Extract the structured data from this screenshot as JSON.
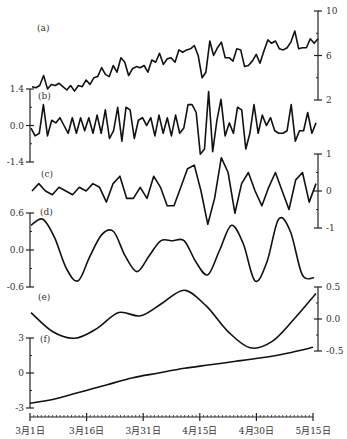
{
  "chart_data": {
    "type": "line",
    "title": "",
    "xlabel": "",
    "x_tick_labels": [
      "3月1日",
      "3月16日",
      "3月31日",
      "4月15日",
      "4月30日",
      "5月15日"
    ],
    "x_range": [
      "3月1日",
      "5月15日"
    ],
    "panels": [
      {
        "label": "(a)",
        "axis_side": "right",
        "yticks": [
          "10",
          "6",
          "2"
        ],
        "ylim": [
          2,
          10
        ],
        "description": "original series, rising trend with noise",
        "values": [
          3.2,
          3.1,
          3.3,
          4.2,
          3.0,
          3.4,
          3.3,
          3.5,
          3.2,
          2.9,
          3.3,
          2.8,
          3.3,
          3.2,
          3.8,
          3.4,
          4.0,
          4.1,
          4.9,
          4.3,
          4.1,
          5.1,
          4.5,
          5.8,
          5.4,
          4.2,
          4.8,
          5.0,
          4.9,
          5.1,
          4.5,
          5.6,
          5.4,
          6.2,
          5.2,
          5.7,
          5.8,
          5.4,
          6.5,
          6.3,
          6.5,
          6.6,
          6.9,
          6.0,
          4.0,
          4.5,
          7.3,
          6.0,
          6.7,
          7.2,
          5.8,
          5.8,
          5.5,
          6.6,
          6.5,
          5.0,
          5.1,
          5.5,
          6.1,
          5.3,
          6.4,
          7.4,
          7.1,
          7.3,
          6.6,
          6.5,
          6.7,
          7.2,
          8.2,
          6.6,
          6.7,
          6.7,
          7.5,
          7.1,
          7.5
        ]
      },
      {
        "label": "(b)",
        "axis_side": "left",
        "yticks": [
          "1.4",
          "0.0",
          "-1.4"
        ],
        "ylim": [
          -1.4,
          1.4
        ],
        "description": "high-frequency component",
        "values": [
          -0.1,
          -0.4,
          -0.3,
          0.8,
          -0.4,
          0.2,
          0.1,
          0.3,
          0.0,
          -0.3,
          0.3,
          -0.3,
          0.3,
          -0.2,
          0.3,
          -0.3,
          0.4,
          -0.3,
          0.6,
          -0.5,
          -0.2,
          0.7,
          -0.6,
          0.7,
          0.6,
          -0.5,
          0.2,
          0.3,
          0.0,
          0.3,
          -0.4,
          0.4,
          -0.3,
          0.3,
          -0.4,
          0.4,
          -0.3,
          -0.1,
          0.8,
          0.8,
          0.5,
          -1.1,
          -0.9,
          1.3,
          -1.0,
          0.2,
          1.0,
          -0.4,
          0.1,
          -0.3,
          0.7,
          0.6,
          -0.9,
          -0.3,
          0.8,
          -0.3,
          0.4,
          0.0,
          0.3,
          -0.2,
          -0.3,
          -0.3,
          -0.2,
          0.8,
          -0.6,
          -0.2,
          -0.2,
          0.5,
          -0.3,
          0.1
        ]
      },
      {
        "label": "(c)",
        "axis_side": "right",
        "yticks": [
          "1",
          "0",
          "-1"
        ],
        "ylim": [
          -1,
          1
        ],
        "description": "intermediate oscillatory component",
        "values": [
          0.0,
          0.2,
          0.0,
          -0.1,
          0.1,
          0.0,
          -0.1,
          0.1,
          0.0,
          0.2,
          0.1,
          -0.3,
          0.2,
          0.4,
          -0.2,
          -0.2,
          0.1,
          -0.2,
          0.4,
          0.1,
          -0.4,
          -0.4,
          0.1,
          0.6,
          0.7,
          0.0,
          -0.9,
          -0.2,
          0.9,
          0.5,
          -0.6,
          0.2,
          0.5,
          0.0,
          -0.4,
          0.1,
          0.5,
          0.0,
          -0.5,
          0.3,
          0.5,
          -0.3,
          0.2
        ]
      },
      {
        "label": "(d)",
        "axis_side": "left",
        "yticks": [
          "0.6",
          "0.0",
          "-0.6"
        ],
        "ylim": [
          -0.6,
          0.6
        ],
        "description": "lower-frequency oscillation",
        "values": [
          0.4,
          0.5,
          0.2,
          -0.3,
          -0.5,
          -0.1,
          0.25,
          0.3,
          -0.1,
          -0.35,
          -0.1,
          0.15,
          0.15,
          0.15,
          -0.2,
          -0.4,
          0.0,
          0.4,
          0.1,
          -0.5,
          -0.2,
          0.5,
          0.3,
          -0.4,
          -0.45
        ]
      },
      {
        "label": "(e)",
        "axis_side": "right",
        "yticks": [
          "0.5",
          "0.0",
          "-0.5"
        ],
        "ylim": [
          -0.5,
          0.5
        ],
        "description": "very low-frequency oscillation",
        "values": [
          0.1,
          -0.2,
          -0.3,
          -0.15,
          0.1,
          0.05,
          0.25,
          0.45,
          0.2,
          -0.2,
          -0.45,
          -0.35,
          0.0,
          0.4
        ]
      },
      {
        "label": "(f)",
        "axis_side": "left",
        "yticks": [
          "3",
          "0",
          "-3"
        ],
        "ylim": [
          -3,
          3
        ],
        "description": "trend component, monotonic increase",
        "values": [
          -2.6,
          -2.2,
          -1.6,
          -1.0,
          -0.4,
          0.0,
          0.4,
          0.7,
          1.0,
          1.3,
          1.7,
          2.2
        ]
      }
    ]
  }
}
